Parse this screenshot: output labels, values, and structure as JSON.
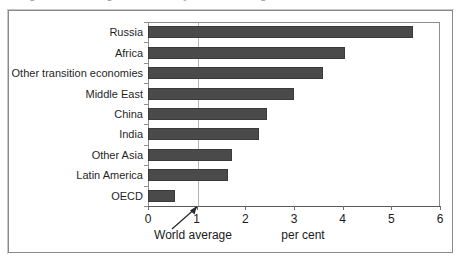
{
  "figure": {
    "frame_color": "#8a8a8a",
    "background": "#ffffff",
    "title_remnant": "g g y g"
  },
  "chart_data": {
    "type": "bar",
    "orientation": "horizontal",
    "title": "",
    "subtitle": "",
    "xlabel": "per cent",
    "ylabel": "",
    "xlim": [
      0,
      6
    ],
    "ylim": null,
    "grid": true,
    "gridlines": [
      1
    ],
    "legend": null,
    "bar_color": "#4a4a4a",
    "categories": [
      "Russia",
      "Africa",
      "Other transition economies",
      "Middle East",
      "China",
      "India",
      "Other Asia",
      "Latin America",
      "OECD"
    ],
    "values": [
      5.45,
      4.05,
      3.6,
      3.0,
      2.45,
      2.28,
      1.72,
      1.65,
      0.55
    ],
    "xticks": [
      0,
      1,
      2,
      3,
      4,
      5,
      6
    ],
    "xticklabels": [
      "0",
      "1",
      "2",
      "3",
      "4",
      "5",
      "6"
    ],
    "annotations": [
      {
        "text": "World average",
        "points_to_x": 1,
        "marker": "arrow"
      },
      {
        "text": "per cent",
        "points_to_x": null,
        "marker": "none"
      }
    ]
  }
}
